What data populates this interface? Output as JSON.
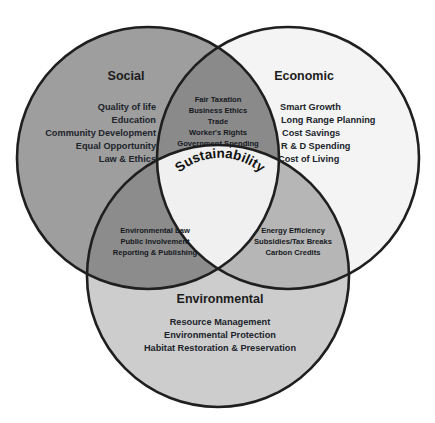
{
  "diagram": {
    "type": "venn-3-circle",
    "title_center": "Sustainability",
    "geometry": {
      "social": {
        "cx": 148,
        "cy": 158,
        "r": 131
      },
      "economic": {
        "cx": 288,
        "cy": 158,
        "r": 131
      },
      "environmental": {
        "cx": 218,
        "cy": 276,
        "r": 131
      }
    },
    "colors": {
      "social_fill": "#9e9e9e",
      "economic_fill": "#f4f4f4",
      "environmental_fill": "#cdcdcd",
      "social_economic_fill": "#8a8a8a",
      "social_environmental_fill": "#8c8c8c",
      "economic_environmental_fill": "#b6b6b6",
      "center_fill": "#f0f0f0",
      "outline": "#1f1f1f",
      "text": "#1c1c1c",
      "background": "#ffffff"
    },
    "circles": [
      {
        "id": "social",
        "name": "Social",
        "items": [
          "Quality of life",
          "Education",
          "Community Development",
          "Equal Opportunity",
          "Law & Ethics"
        ]
      },
      {
        "id": "economic",
        "name": "Economic",
        "items": [
          "Smart Growth",
          "Long Range Planning",
          "Cost Savings",
          "R & D Spending",
          "Cost of Living"
        ]
      },
      {
        "id": "environmental",
        "name": "Environmental",
        "items": [
          "Resource Management",
          "Environmental Protection",
          "Habitat Restoration & Preservation"
        ]
      }
    ],
    "overlaps": [
      {
        "id": "social-economic",
        "between": [
          "Social",
          "Economic"
        ],
        "items": [
          "Fair Taxation",
          "Business Ethics",
          "Trade",
          "Worker's Rights",
          "Government Spending"
        ]
      },
      {
        "id": "social-environmental",
        "between": [
          "Social",
          "Environmental"
        ],
        "items": [
          "Environmental Law",
          "Public Involvement",
          "Reporting & Publishing"
        ]
      },
      {
        "id": "economic-environmental",
        "between": [
          "Economic",
          "Environmental"
        ],
        "items": [
          "Energy Efficiency",
          "Subsidies/Tax Breaks",
          "Carbon Credits"
        ]
      }
    ],
    "center_overlap": {
      "id": "all-three",
      "between": [
        "Social",
        "Economic",
        "Environmental"
      ],
      "label": "Sustainability"
    }
  }
}
